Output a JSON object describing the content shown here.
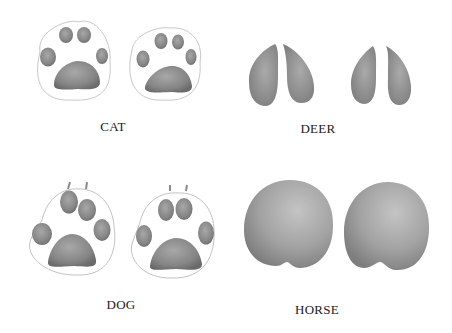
{
  "panels": [
    {
      "id": "cat",
      "label": "CAT",
      "track_count": 2,
      "label_pos": {
        "x": 113,
        "y": 119
      }
    },
    {
      "id": "deer",
      "label": "DEER",
      "track_count": 2,
      "label_pos": {
        "x": 318,
        "y": 121
      }
    },
    {
      "id": "dog",
      "label": "DOG",
      "track_count": 2,
      "label_pos": {
        "x": 121,
        "y": 297
      }
    },
    {
      "id": "horse",
      "label": "HORSE",
      "track_count": 2,
      "label_pos": {
        "x": 317,
        "y": 302
      }
    }
  ],
  "colors": {
    "background": "#ffffff",
    "pad_fill": "#8c8c8c",
    "pad_dark": "#6e6e6e",
    "outline": "#b5b5b5",
    "label": "#1a1a1a"
  }
}
